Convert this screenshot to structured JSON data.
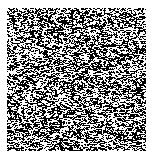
{
  "image": {
    "title": "Random binary noise texture",
    "description": "A dense field of randomly placed black and white pixels forming a high-frequency salt-and-pepper noise pattern, centered on a plain white background with a narrow white margin on all sides.",
    "width": 154,
    "height": 162,
    "background_color": "#ffffff"
  },
  "noise_region": {
    "name": "noise-texture",
    "x": 7,
    "y": 8,
    "width": 139,
    "height": 143,
    "pattern_type": "salt-and-pepper",
    "foreground_color": "#000000",
    "background_color": "#ffffff",
    "black_fraction": 0.5,
    "cell_size_px": 1,
    "seed": 20240613
  },
  "margins": {
    "left": 7,
    "top": 8,
    "right": 8,
    "bottom": 11
  }
}
